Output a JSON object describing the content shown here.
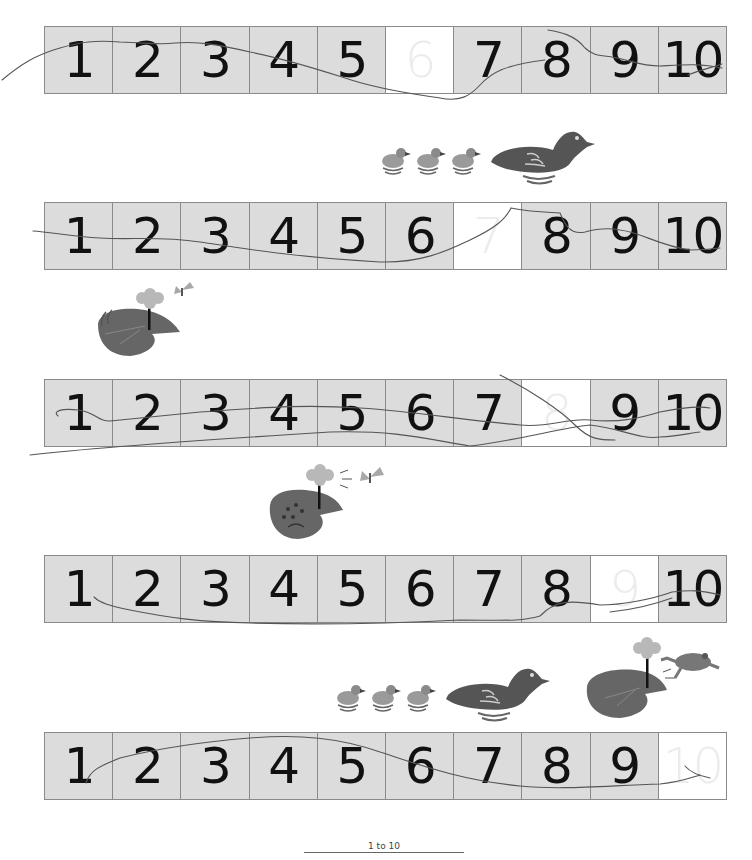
{
  "worksheet": {
    "rows": [
      {
        "cells": [
          "1",
          "2",
          "3",
          "4",
          "5",
          "6",
          "7",
          "8",
          "9",
          "10"
        ],
        "missing_index": 5
      },
      {
        "cells": [
          "1",
          "2",
          "3",
          "4",
          "5",
          "6",
          "7",
          "8",
          "9",
          "10"
        ],
        "missing_index": 6
      },
      {
        "cells": [
          "1",
          "2",
          "3",
          "4",
          "5",
          "6",
          "7",
          "8",
          "9",
          "10"
        ],
        "missing_index": 7
      },
      {
        "cells": [
          "1",
          "2",
          "3",
          "4",
          "5",
          "6",
          "7",
          "8",
          "9",
          "10"
        ],
        "missing_index": 8
      },
      {
        "cells": [
          "1",
          "2",
          "3",
          "4",
          "5",
          "6",
          "7",
          "8",
          "9",
          "10"
        ],
        "missing_index": 9
      }
    ],
    "colors": {
      "cell_fill": "#dcdcdc",
      "missing_fill": "#ffffff",
      "border": "#8a8a8a",
      "digit": "#111111",
      "pencil": "#555555"
    },
    "illustrations": [
      {
        "name": "ducklings-and-duck",
        "position": "between rows 1 and 2"
      },
      {
        "name": "lily-pad-with-flower-and-butterfly",
        "position": "between rows 2 and 3"
      },
      {
        "name": "frog-on-lily-pad-with-butterfly",
        "position": "between rows 3 and 4"
      },
      {
        "name": "ducklings-and-duck",
        "position": "between rows 4 and 5, left"
      },
      {
        "name": "frog-jumping-off-lily-pad",
        "position": "between rows 4 and 5, right"
      }
    ]
  },
  "footer": {
    "label": "1 to 10"
  }
}
